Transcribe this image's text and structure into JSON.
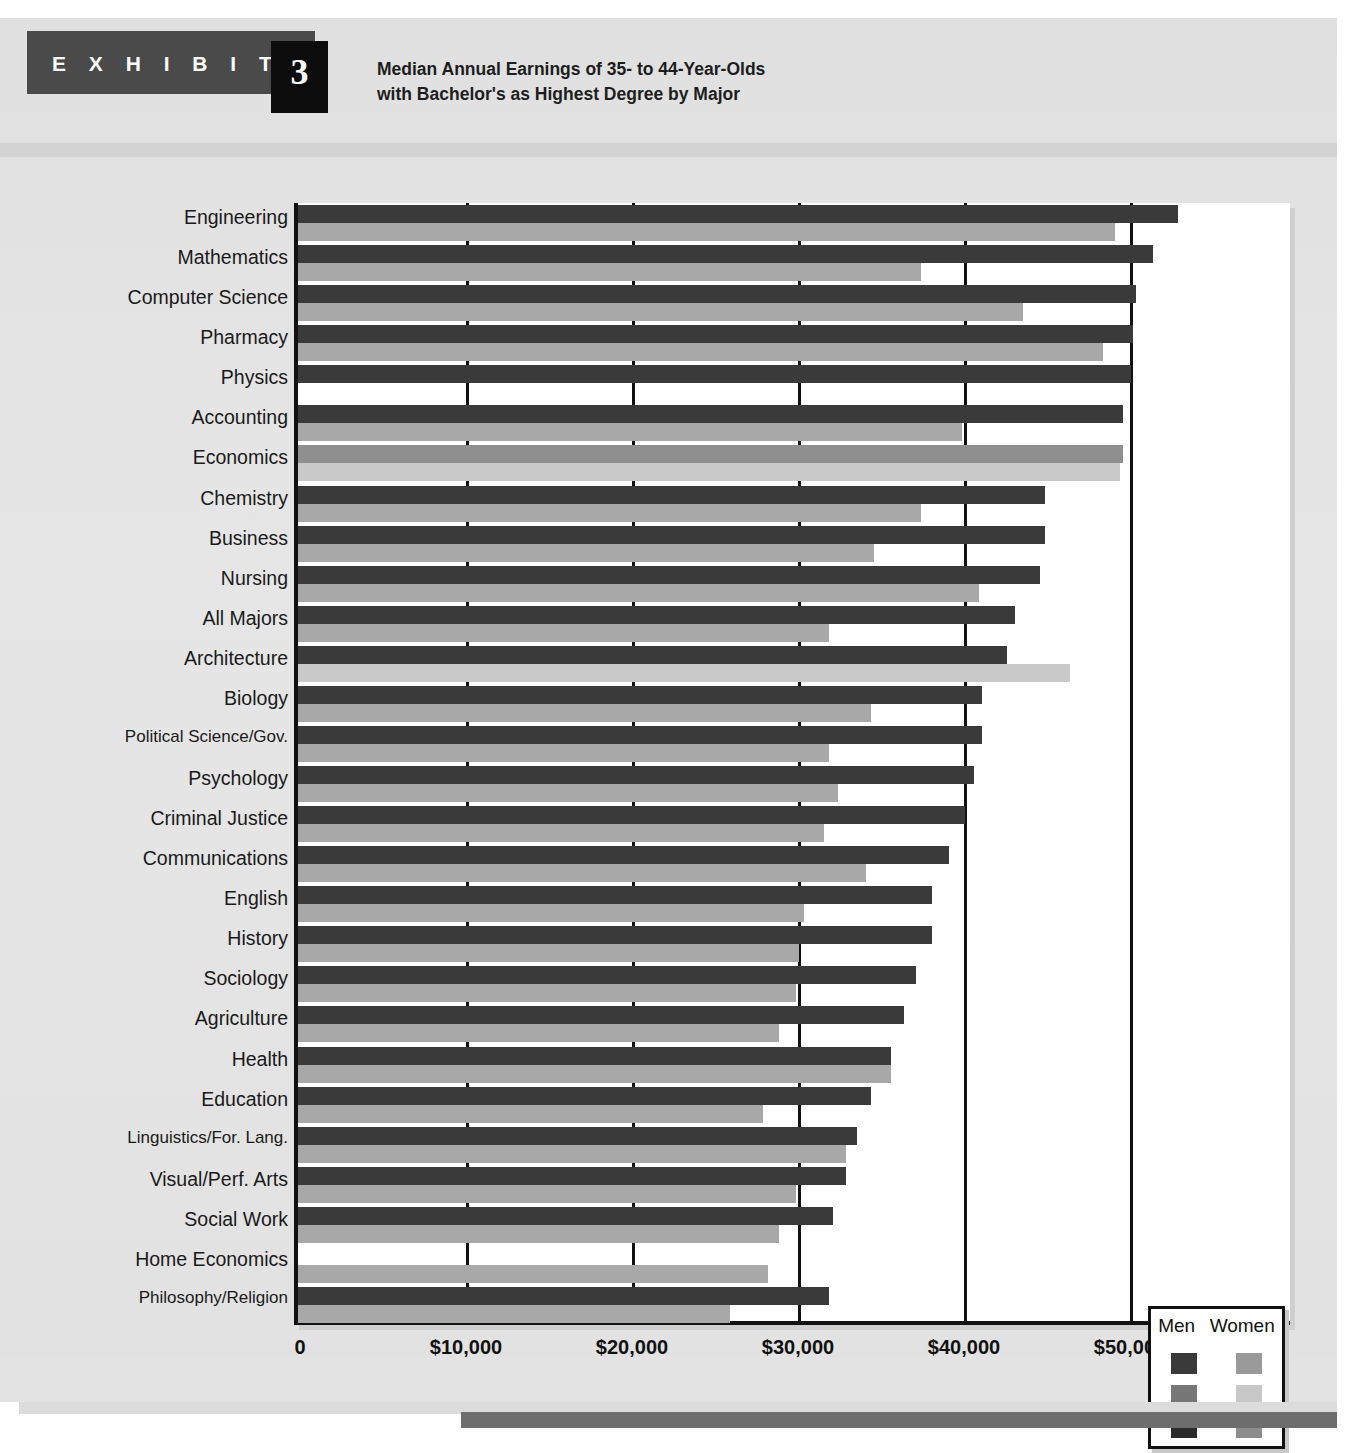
{
  "exhibit": {
    "label": "E X H I B I T",
    "number": "3",
    "title_line1": "Median Annual Earnings of 35- to 44-Year-Olds",
    "title_line2": "with Bachelor's as Highest Degree by Major"
  },
  "legend": {
    "men_header": "Men",
    "women_header": "Women",
    "swatches": [
      {
        "men": "#3a3a3a",
        "women": "#9a9a9a"
      },
      {
        "men": "#777777",
        "women": "#c8c8c8"
      },
      {
        "men": "#2b2b2b",
        "women": "#8d8d8d"
      }
    ]
  },
  "colors": {
    "men_dark": "#3a3a3a",
    "men_mid": "#8f8f8f",
    "women_light": "#a8a8a8",
    "women_pale": "#c9c9c9",
    "axis": "#111111",
    "panel": "#e3e3e3",
    "tab": "#4a4a4a",
    "numbox": "#0c0c0c"
  },
  "chart_data": {
    "type": "bar",
    "orientation": "horizontal",
    "title": "Median Annual Earnings of 35- to 44-Year-Olds with Bachelor's as Highest Degree by Major",
    "xlabel": "",
    "ylabel": "",
    "xlim": [
      0,
      60000
    ],
    "xticks": [
      0,
      10000,
      20000,
      30000,
      40000,
      50000
    ],
    "xtick_labels": [
      "0",
      "$10,000",
      "$20,000",
      "$30,000",
      "$40,000",
      "$50,000"
    ],
    "grid": true,
    "legend_position": "bottom-right",
    "categories": [
      "Engineering",
      "Mathematics",
      "Computer Science",
      "Pharmacy",
      "Physics",
      "Accounting",
      "Economics",
      "Chemistry",
      "Business",
      "Nursing",
      "All Majors",
      "Architecture",
      "Biology",
      "Political Science/Gov.",
      "Psychology",
      "Criminal Justice",
      "Communications",
      "English",
      "History",
      "Sociology",
      "Agriculture",
      "Health",
      "Education",
      "Linguistics/For. Lang.",
      "Visual/Perf. Arts",
      "Social Work",
      "Home Economics",
      "Philosophy/Religion"
    ],
    "series": [
      {
        "name": "Men",
        "values": [
          53000,
          51500,
          50500,
          50300,
          50200,
          49700,
          49700,
          45000,
          45000,
          44700,
          43200,
          42700,
          41200,
          41200,
          40700,
          40200,
          39200,
          38200,
          38200,
          37200,
          36500,
          35700,
          34500,
          33700,
          33000,
          32200,
          0,
          32000
        ]
      },
      {
        "name": "Women",
        "values": [
          49200,
          37500,
          43700,
          48500,
          0,
          40000,
          49500,
          37500,
          34700,
          41000,
          32000,
          46500,
          34500,
          32000,
          32500,
          31700,
          34200,
          30500,
          30200,
          30000,
          29000,
          35700,
          28000,
          33000,
          30000,
          29000,
          28300,
          26000
        ]
      }
    ]
  },
  "y_labels": [
    "Engineering",
    "Mathematics",
    "Computer Science",
    "Pharmacy",
    "Physics",
    "Accounting",
    "Economics",
    "Chemistry",
    "Business",
    "Nursing",
    "All Majors",
    "Architecture",
    "Biology",
    "Political Science/Gov.",
    "Psychology",
    "Criminal Justice",
    "Communications",
    "English",
    "History",
    "Sociology",
    "Agriculture",
    "Health",
    "Education",
    "Linguistics/For. Lang.",
    "Visual/Perf. Arts",
    "Social Work",
    "Home Economics",
    "Philosophy/Religion"
  ],
  "x_labels": [
    "0",
    "$10,000",
    "$20,000",
    "$30,000",
    "$40,000",
    "$50,000"
  ]
}
